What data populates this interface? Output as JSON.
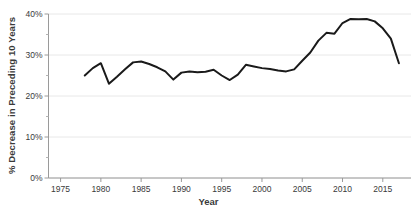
{
  "chart_data": {
    "type": "line",
    "title": "",
    "xlabel": "Year",
    "ylabel": "% Decrease in Preceding 10 Years",
    "xlim": [
      1973.5,
      2018.5
    ],
    "ylim": [
      0,
      40
    ],
    "grid": "horizontal-major",
    "legend": "none",
    "y_ticks": [
      0,
      10,
      20,
      30,
      40
    ],
    "y_tick_labels": [
      "0%",
      "10%",
      "20%",
      "30%",
      "40%"
    ],
    "y_minor_ticks": [
      5,
      15,
      25,
      35
    ],
    "x_ticks": [
      1975,
      1980,
      1985,
      1990,
      1995,
      2000,
      2005,
      2010,
      2015
    ],
    "x_tick_labels": [
      "1975",
      "1980",
      "1985",
      "1990",
      "1995",
      "2000",
      "2005",
      "2010",
      "2015"
    ],
    "series": [
      {
        "name": "% Decrease in Preceding 10 Years",
        "color": "#1a1a1a",
        "line_width": 2.0,
        "x": [
          1978,
          1979,
          1980,
          1981,
          1982,
          1983,
          1984,
          1985,
          1986,
          1987,
          1988,
          1989,
          1990,
          1991,
          1992,
          1993,
          1994,
          1995,
          1996,
          1997,
          1998,
          1999,
          2000,
          2001,
          2002,
          2003,
          2004,
          2005,
          2006,
          2007,
          2008,
          2009,
          2010,
          2011,
          2012,
          2013,
          2014,
          2015,
          2016,
          2017
        ],
        "values": [
          25.0,
          26.8,
          28.0,
          23.0,
          24.7,
          26.5,
          28.2,
          28.4,
          27.8,
          27.0,
          26.0,
          24.0,
          25.7,
          26.0,
          25.8,
          25.9,
          26.4,
          25.0,
          23.9,
          25.2,
          27.6,
          27.2,
          26.8,
          26.6,
          26.2,
          26.0,
          26.5,
          28.6,
          30.6,
          33.5,
          35.4,
          35.2,
          37.8,
          38.8,
          38.7,
          38.8,
          38.2,
          36.5,
          34.0,
          28.0
        ]
      }
    ]
  },
  "axes": {
    "y_title": "% Decrease in Preceding 10 Years",
    "x_title": "Year"
  }
}
